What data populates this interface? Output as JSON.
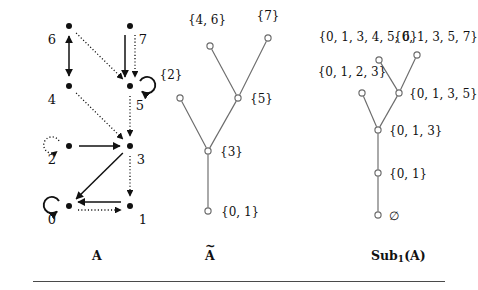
{
  "figure": {
    "width": 478,
    "height": 290,
    "background": "#ffffff",
    "ink": "#111111",
    "tree_stroke": "#6b6b6b"
  },
  "captions": {
    "left": "A",
    "middle_base": "A",
    "middle_accent": "~",
    "right_prefix": "Sub",
    "right_subscript": "1",
    "right_suffix": "(A)"
  },
  "panel_A": {
    "title": "A",
    "node_labels": [
      "0",
      "1",
      "2",
      "3",
      "4",
      "5",
      "6",
      "7"
    ],
    "nodes": [
      {
        "id": "6",
        "label": "6",
        "x": 69,
        "y": 26,
        "label_x": 52,
        "label_y": 44
      },
      {
        "id": "7",
        "label": "7",
        "x": 130,
        "y": 26,
        "label_x": 143,
        "label_y": 44
      },
      {
        "id": "4",
        "label": "4",
        "x": 69,
        "y": 86,
        "label_x": 52,
        "label_y": 104
      },
      {
        "id": "5",
        "label": "5",
        "x": 130,
        "y": 86,
        "label_x": 140,
        "label_y": 110
      },
      {
        "id": "2",
        "label": "2",
        "x": 69,
        "y": 146,
        "label_x": 52,
        "label_y": 164
      },
      {
        "id": "3",
        "label": "3",
        "x": 130,
        "y": 146,
        "label_x": 141,
        "label_y": 164
      },
      {
        "id": "0",
        "label": "0",
        "x": 69,
        "y": 206,
        "label_x": 52,
        "label_y": 224
      },
      {
        "id": "1",
        "label": "1",
        "x": 130,
        "y": 206,
        "label_x": 143,
        "label_y": 224
      }
    ],
    "edges": [
      {
        "from": "6",
        "to": "4",
        "style": "solid",
        "kind": "bidirectional-vertical"
      },
      {
        "from": "6",
        "to": "5",
        "style": "dotted",
        "kind": "diagonal"
      },
      {
        "from": "7",
        "to": "5",
        "style": "solid",
        "kind": "vertical-left"
      },
      {
        "from": "7",
        "to": "5",
        "style": "dotted",
        "kind": "vertical-right"
      },
      {
        "from": "5",
        "to": "5",
        "style": "solid",
        "kind": "self-loop-right"
      },
      {
        "from": "5",
        "to": "3",
        "style": "dotted",
        "kind": "vertical"
      },
      {
        "from": "4",
        "to": "3",
        "style": "dotted",
        "kind": "diagonal"
      },
      {
        "from": "2",
        "to": "2",
        "style": "dotted",
        "kind": "self-loop-left"
      },
      {
        "from": "2",
        "to": "3",
        "style": "solid",
        "kind": "horizontal"
      },
      {
        "from": "3",
        "to": "0",
        "style": "solid",
        "kind": "diagonal"
      },
      {
        "from": "3",
        "to": "1",
        "style": "dotted",
        "kind": "vertical"
      },
      {
        "from": "0",
        "to": "0",
        "style": "solid",
        "kind": "self-loop-left"
      },
      {
        "from": "1",
        "to": "0",
        "style": "solid",
        "kind": "horizontal-upper"
      },
      {
        "from": "0",
        "to": "1",
        "style": "dotted",
        "kind": "horizontal-lower"
      }
    ]
  },
  "panel_Atilde": {
    "nodes": [
      {
        "id": "t46",
        "label": "{4, 6}",
        "x": 210,
        "y": 46,
        "label_x": 207,
        "label_y": 24,
        "anchor": "middle"
      },
      {
        "id": "t7",
        "label": "{7}",
        "x": 268,
        "y": 38,
        "label_x": 268,
        "label_y": 20,
        "anchor": "middle"
      },
      {
        "id": "t2",
        "label": "{2}",
        "x": 180,
        "y": 98,
        "label_x": 171,
        "label_y": 79,
        "anchor": "middle"
      },
      {
        "id": "t5",
        "label": "{5}",
        "x": 238,
        "y": 98,
        "label_x": 250,
        "label_y": 103,
        "anchor": "start"
      },
      {
        "id": "t3",
        "label": "{3}",
        "x": 208,
        "y": 151,
        "label_x": 220,
        "label_y": 156,
        "anchor": "start"
      },
      {
        "id": "t01",
        "label": "{0, 1}",
        "x": 208,
        "y": 211,
        "label_x": 221,
        "label_y": 216,
        "anchor": "start"
      }
    ],
    "edges": [
      {
        "from": "t46",
        "to": "t5"
      },
      {
        "from": "t7",
        "to": "t5"
      },
      {
        "from": "t5",
        "to": "t3"
      },
      {
        "from": "t2",
        "to": "t3"
      },
      {
        "from": "t3",
        "to": "t01"
      }
    ]
  },
  "panel_Sub1": {
    "nodes": [
      {
        "id": "s013456",
        "label": "{0, 1, 3, 4, 5, 6}",
        "x": 379,
        "y": 60,
        "label_x": 368,
        "label_y": 41,
        "anchor": "middle"
      },
      {
        "id": "s01357",
        "label": "{0, 1, 3, 5, 7}",
        "x": 417,
        "y": 55,
        "label_x": 436,
        "label_y": 41,
        "anchor": "middle"
      },
      {
        "id": "s0123",
        "label": "{0, 1, 2, 3}",
        "x": 362,
        "y": 93,
        "label_x": 352,
        "label_y": 76,
        "anchor": "middle"
      },
      {
        "id": "s0135",
        "label": "{0, 1, 3, 5}",
        "x": 399,
        "y": 93,
        "label_x": 409,
        "label_y": 98,
        "anchor": "start"
      },
      {
        "id": "s013",
        "label": "{0, 1, 3}",
        "x": 378,
        "y": 130,
        "label_x": 389,
        "label_y": 135,
        "anchor": "start"
      },
      {
        "id": "s01",
        "label": "{0, 1}",
        "x": 378,
        "y": 173,
        "label_x": 389,
        "label_y": 178,
        "anchor": "start"
      },
      {
        "id": "sempty",
        "label": "∅",
        "x": 378,
        "y": 215,
        "label_x": 389,
        "label_y": 220,
        "anchor": "start"
      }
    ],
    "edges": [
      {
        "from": "s013456",
        "to": "s0135"
      },
      {
        "from": "s01357",
        "to": "s0135"
      },
      {
        "from": "s0135",
        "to": "s013"
      },
      {
        "from": "s0123",
        "to": "s013"
      },
      {
        "from": "s013",
        "to": "s01"
      },
      {
        "from": "s01",
        "to": "sempty"
      }
    ]
  }
}
